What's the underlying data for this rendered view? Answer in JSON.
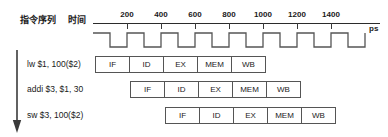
{
  "header": {
    "sequence_label": "指令序列",
    "time_label": "时间"
  },
  "axis": {
    "unit": "ps",
    "ticks": [
      {
        "value": 200,
        "label": "200"
      },
      {
        "value": 400,
        "label": "400"
      },
      {
        "value": 600,
        "label": "600"
      },
      {
        "value": 800,
        "label": "800"
      },
      {
        "value": 1000,
        "label": "1000"
      },
      {
        "value": 1200,
        "label": "1200"
      },
      {
        "value": 1400,
        "label": "1400"
      }
    ],
    "start": 0,
    "end": 1600,
    "pixels_per_200ps": 34,
    "axis_color": "#2b2b2b"
  },
  "clock": {
    "name": "clock-waveform",
    "period_ps": 200,
    "duty": 0.5,
    "starts_high": true,
    "cycles": 8,
    "color": "#555555"
  },
  "instructions": [
    {
      "text": "lw $1, 100($2)",
      "start_cycle": 0
    },
    {
      "text": "addi $3, $1, 30",
      "start_cycle": 1
    },
    {
      "text": "sw $3, 100($2)",
      "start_cycle": 2
    }
  ],
  "stages": [
    "IF",
    "ID",
    "EX",
    "MEM",
    "WB"
  ],
  "rows": [
    {
      "instruction": "lw $1, 100($2)",
      "cells": [
        "IF",
        "ID",
        "EX",
        "MEM",
        "WB"
      ]
    },
    {
      "instruction": "addi $3, $1, 30",
      "cells": [
        "IF",
        "ID",
        "EX",
        "MEM",
        "WB"
      ]
    },
    {
      "instruction": "sw $3, 100($2)",
      "cells": [
        "IF",
        "ID",
        "EX",
        "MEM",
        "WB"
      ]
    }
  ],
  "arrow": {
    "name": "instruction-sequence-arrow",
    "direction": "down",
    "color": "#3a3a3a"
  },
  "colors": {
    "box_border": "#555555",
    "text": "#1a1a1a",
    "background": "#ffffff"
  }
}
